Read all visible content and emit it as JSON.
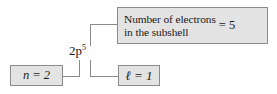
{
  "diagram": {
    "orbital_label": {
      "base": "2p",
      "superscript": "5"
    },
    "boxes": {
      "electron_count": {
        "phrase_line1": "Number of electrons",
        "phrase_line2": "in the subshell",
        "equals": "= 5"
      },
      "principal_quantum_number": {
        "text": "n = 2"
      },
      "azimuthal_quantum_number": {
        "text": "ℓ = 1"
      }
    },
    "colors": {
      "box_fill": "#e3e3e3",
      "box_border": "#8a8a8a",
      "connector": "#8a8a8a",
      "text": "#1a1a1a",
      "background": "#ffffff"
    }
  }
}
